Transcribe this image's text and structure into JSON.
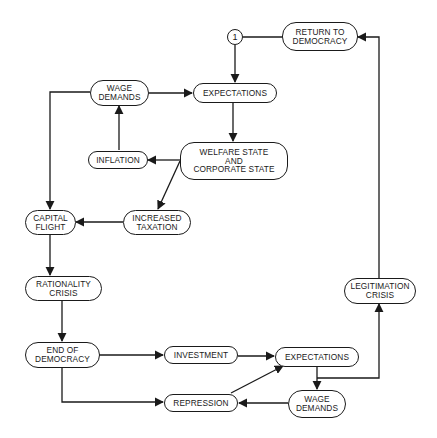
{
  "diagram": {
    "colors": {
      "line": "#1a1a1a",
      "background": "#ffffff",
      "text": "#1a1a1a"
    },
    "nodes": {
      "connector_1": "1",
      "return_to_democracy": "RETURN TO\nDEMOCRACY",
      "wage_demands_top": "WAGE\nDEMANDS",
      "expectations_top": "EXPECTATIONS",
      "inflation": "INFLATION",
      "welfare_state": "WELFARE STATE\nAND\nCORPORATE STATE",
      "capital_flight": "CAPITAL\nFLIGHT",
      "increased_taxation": "INCREASED\nTAXATION",
      "rationality_crisis": "RATIONALITY\nCRISIS",
      "end_of_democracy": "END OF\nDEMOCRACY",
      "investment": "INVESTMENT",
      "expectations_bottom": "EXPECTATIONS",
      "legitimation_crisis": "LEGITIMATION\nCRISIS",
      "repression": "REPRESSION",
      "wage_demands_bottom": "WAGE\nDEMANDS"
    },
    "edges": [
      {
        "from": "1",
        "to": "EXPECTATIONS (top)"
      },
      {
        "from": "RETURN TO DEMOCRACY",
        "to": "1",
        "arrow": false
      },
      {
        "from": "WAGE DEMANDS (top)",
        "to": "EXPECTATIONS (top)"
      },
      {
        "from": "EXPECTATIONS (top)",
        "to": "WELFARE STATE AND CORPORATE STATE"
      },
      {
        "from": "WELFARE STATE AND CORPORATE STATE",
        "to": "INFLATION"
      },
      {
        "from": "WELFARE STATE AND CORPORATE STATE",
        "to": "INCREASED TAXATION"
      },
      {
        "from": "INFLATION",
        "to": "WAGE DEMANDS (top)"
      },
      {
        "from": "WAGE DEMANDS (top)",
        "to": "CAPITAL FLIGHT"
      },
      {
        "from": "INCREASED TAXATION",
        "to": "CAPITAL FLIGHT"
      },
      {
        "from": "CAPITAL FLIGHT",
        "to": "RATIONALITY CRISIS"
      },
      {
        "from": "RATIONALITY CRISIS",
        "to": "END OF DEMOCRACY"
      },
      {
        "from": "END OF DEMOCRACY",
        "to": "INVESTMENT"
      },
      {
        "from": "END OF DEMOCRACY",
        "to": "REPRESSION"
      },
      {
        "from": "INVESTMENT",
        "to": "EXPECTATIONS (bottom)"
      },
      {
        "from": "REPRESSION",
        "to": "EXPECTATIONS (bottom)"
      },
      {
        "from": "EXPECTATIONS (bottom)",
        "to": "WAGE DEMANDS (bottom)"
      },
      {
        "from": "EXPECTATIONS (bottom)",
        "to": "LEGITIMATION CRISIS"
      },
      {
        "from": "WAGE DEMANDS (bottom)",
        "to": "REPRESSION"
      },
      {
        "from": "LEGITIMATION CRISIS",
        "to": "RETURN TO DEMOCRACY"
      }
    ]
  }
}
